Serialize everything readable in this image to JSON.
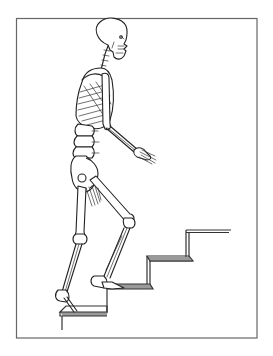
{
  "illustration": {
    "subject": "Skeleton walking up stairs",
    "style": "black line art on white",
    "frame": {
      "x": 16,
      "y": 18,
      "width": 241,
      "height": 320,
      "stroke": "#666666"
    },
    "stairs": {
      "step_count": 4,
      "ascending_direction": "right"
    },
    "colors": {
      "ink": "#222222",
      "background": "#ffffff",
      "stair_shade": "#9a9a9a"
    }
  }
}
